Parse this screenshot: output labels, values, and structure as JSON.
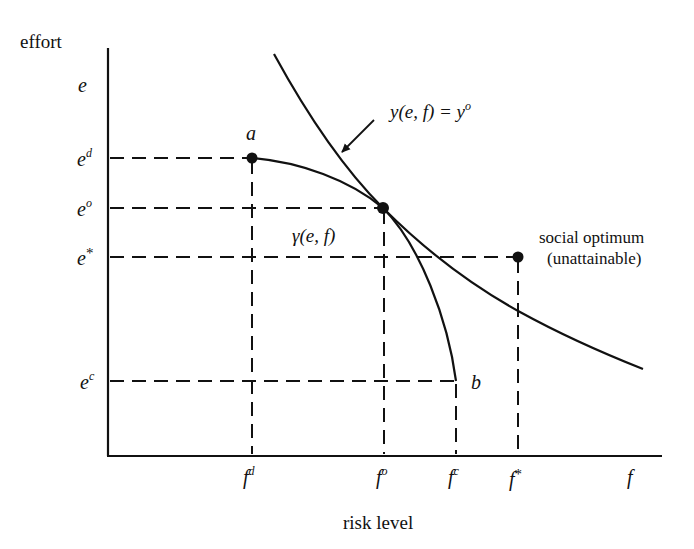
{
  "diagram": {
    "y_axis_label": "effort",
    "x_axis_label": "risk level",
    "y_axis_symbol": "e",
    "x_axis_symbol": "f",
    "y_ticks": [
      {
        "base": "e",
        "sup": "d"
      },
      {
        "base": "e",
        "sup": "o"
      },
      {
        "base": "e",
        "sup": "*"
      },
      {
        "base": "e",
        "sup": "c"
      }
    ],
    "x_ticks": [
      {
        "base": "f",
        "sup": "d"
      },
      {
        "base": "f",
        "sup": "o"
      },
      {
        "base": "f",
        "sup": "c"
      },
      {
        "base": "f",
        "sup": "*"
      }
    ],
    "point_a_label": "a",
    "point_b_label": "b",
    "frontier_label": "γ(e, f)",
    "isocurve_label": "y(e, f) = y",
    "isocurve_label_sup": "o",
    "social_optimum_line1": "social optimum",
    "social_optimum_line2": "(unattainable)",
    "line_color": "#111111",
    "background": "#ffffff"
  }
}
